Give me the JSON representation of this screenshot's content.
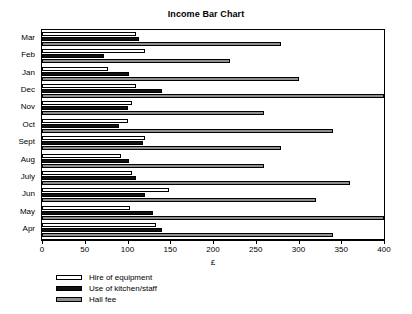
{
  "chart_data": {
    "type": "bar",
    "orientation": "horizontal",
    "title": "Income Bar Chart",
    "xlabel": "£",
    "ylabel": "",
    "xlim": [
      0,
      400
    ],
    "xticks": [
      0,
      50,
      100,
      150,
      200,
      250,
      300,
      350,
      400
    ],
    "xtick_labels": [
      "0",
      "50",
      "100",
      "150",
      "200",
      "250",
      "300",
      "350",
      "400"
    ],
    "grid": false,
    "legend_position": "below-axes-left",
    "categories": [
      "Mar",
      "Feb",
      "Jan",
      "Dec",
      "Nov",
      "Oct",
      "Sept",
      "Aug",
      "July",
      "Jun",
      "May",
      "Apr"
    ],
    "series": [
      {
        "name": "Hire of equipment",
        "color": "#ffffff",
        "values": [
          110,
          120,
          77,
          110,
          105,
          100,
          120,
          92,
          105,
          148,
          103,
          133
        ]
      },
      {
        "name": "Use of kitchen/staff",
        "color": "#111111",
        "values": [
          113,
          72,
          102,
          140,
          100,
          90,
          118,
          102,
          110,
          120,
          130,
          140
        ]
      },
      {
        "name": "Hall fee",
        "color": "#8f8f8f",
        "values": [
          280,
          220,
          300,
          400,
          260,
          340,
          280,
          260,
          360,
          320,
          400,
          340
        ]
      }
    ]
  },
  "legend": {
    "items": [
      {
        "label": "Hire of equipment",
        "key": "hire"
      },
      {
        "label": "Use of kitchen/staff",
        "key": "kitchen"
      },
      {
        "label": "Hall fee",
        "key": "hall"
      }
    ]
  }
}
